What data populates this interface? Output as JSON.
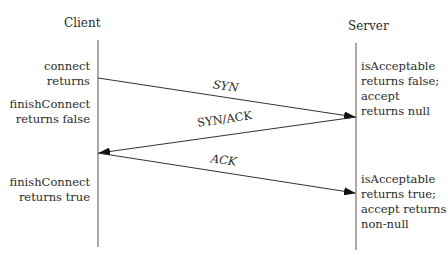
{
  "diagram": {
    "type": "sequence",
    "participants": [
      {
        "name": "Client"
      },
      {
        "name": "Server"
      }
    ],
    "messages": [
      {
        "label": "SYN",
        "from": "Client",
        "to": "Server"
      },
      {
        "label": "SYN/ACK",
        "from": "Server",
        "to": "Client"
      },
      {
        "label": "ACK",
        "from": "Client",
        "to": "Server"
      }
    ],
    "client_notes": [
      {
        "lines": [
          "connect",
          "returns"
        ]
      },
      {
        "lines": [
          "finishConnect",
          "returns false"
        ]
      },
      {
        "lines": [
          "finishConnect",
          "returns true"
        ]
      }
    ],
    "server_notes": [
      {
        "lines": [
          "isAcceptable",
          "returns false;",
          "accept",
          "returns null"
        ]
      },
      {
        "lines": [
          "isAcceptable",
          "returns true;",
          "accept returns",
          "non-null"
        ]
      }
    ]
  }
}
